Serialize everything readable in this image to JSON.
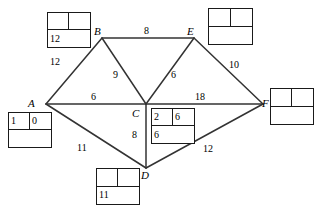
{
  "diagram": {
    "type": "weighted-undirected-graph",
    "title": "",
    "nodes": [
      {
        "id": "A",
        "label": "A",
        "x": 46,
        "y": 104,
        "letter_x": 28,
        "letter_y": 98
      },
      {
        "id": "B",
        "label": "B",
        "x": 102,
        "y": 38,
        "letter_x": 94,
        "letter_y": 26
      },
      {
        "id": "C",
        "label": "C",
        "x": 146,
        "y": 104,
        "letter_x": 132,
        "letter_y": 108
      },
      {
        "id": "D",
        "label": "D",
        "x": 146,
        "y": 168,
        "letter_x": 141,
        "letter_y": 170
      },
      {
        "id": "E",
        "label": "E",
        "x": 194,
        "y": 38,
        "letter_x": 187,
        "letter_y": 26
      },
      {
        "id": "F",
        "label": "F",
        "x": 263,
        "y": 104,
        "letter_x": 262,
        "letter_y": 98
      }
    ],
    "edges": [
      {
        "from": "A",
        "to": "B",
        "weight": "12",
        "label_x": 50,
        "label_y": 57
      },
      {
        "from": "B",
        "to": "E",
        "weight": "8",
        "label_x": 144,
        "label_y": 26
      },
      {
        "from": "B",
        "to": "C",
        "weight": "9",
        "label_x": 113,
        "label_y": 70
      },
      {
        "from": "C",
        "to": "E",
        "weight": "6",
        "label_x": 171,
        "label_y": 70
      },
      {
        "from": "E",
        "to": "F",
        "weight": "10",
        "label_x": 229,
        "label_y": 60
      },
      {
        "from": "A",
        "to": "C",
        "weight": "6",
        "label_x": 91,
        "label_y": 92
      },
      {
        "from": "C",
        "to": "F",
        "weight": "18",
        "label_x": 195,
        "label_y": 92
      },
      {
        "from": "A",
        "to": "D",
        "weight": "11",
        "label_x": 77,
        "label_y": 143
      },
      {
        "from": "C",
        "to": "D",
        "weight": "8",
        "label_x": 132,
        "label_y": 130
      },
      {
        "from": "D",
        "to": "F",
        "weight": "12",
        "label_x": 203,
        "label_y": 144
      }
    ],
    "label_boxes": [
      {
        "node": "B",
        "x": 47,
        "y": 12,
        "width": 44,
        "height": 36,
        "top_left": "",
        "top_right": "",
        "bottom": "12"
      },
      {
        "node": "E",
        "x": 208,
        "y": 8,
        "width": 45,
        "height": 37,
        "top_left": "",
        "top_right": "",
        "bottom": ""
      },
      {
        "node": "F",
        "x": 270,
        "y": 88,
        "width": 44,
        "height": 37,
        "top_left": "",
        "top_right": "",
        "bottom": ""
      },
      {
        "node": "A",
        "x": 8,
        "y": 112,
        "width": 44,
        "height": 36,
        "top_left": "1",
        "top_right": "0",
        "bottom": ""
      },
      {
        "node": "C",
        "x": 151,
        "y": 108,
        "width": 44,
        "height": 36,
        "top_left": "2",
        "top_right": "6",
        "bottom": "6"
      },
      {
        "node": "D",
        "x": 96,
        "y": 168,
        "width": 44,
        "height": 37,
        "top_left": "",
        "top_right": "",
        "bottom": "11"
      }
    ],
    "colors": {
      "stroke": "#1a1a1a",
      "edge": "#333333",
      "background": "#ffffff",
      "text": "#000000"
    }
  }
}
